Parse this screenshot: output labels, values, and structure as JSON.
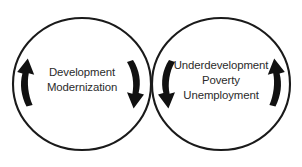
{
  "diagram": {
    "background_color": "#ffffff",
    "stroke_color": "#1a1a1a",
    "text_color": "#2b2b2b",
    "arrow_color": "#111111",
    "left_circle": {
      "name": "development-circle",
      "lines": [
        "Development",
        "Modernization"
      ],
      "line1": "Development",
      "line2": "Modernization"
    },
    "right_circle": {
      "name": "underdevelopment-circle",
      "lines": [
        "Underdevelopment",
        "Poverty",
        "Unemployment"
      ],
      "line1": "Underdevelopment",
      "line2": "Poverty",
      "line3": "Unemployment"
    },
    "arrows": [
      {
        "id": "left-outer-arrow",
        "direction": "up",
        "position": "left-circle-left-side"
      },
      {
        "id": "left-inner-arrow",
        "direction": "down",
        "position": "left-circle-right-side"
      },
      {
        "id": "right-inner-arrow",
        "direction": "down",
        "position": "right-circle-left-side"
      },
      {
        "id": "right-outer-arrow",
        "direction": "up",
        "position": "right-circle-right-side"
      }
    ]
  }
}
